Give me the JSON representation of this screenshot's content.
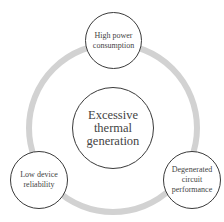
{
  "diagram": {
    "type": "cycle",
    "ring_color": "#d2d2d2",
    "stroke_color": "#3a3a3a",
    "text_color": "#444444",
    "center": {
      "label": "Excessive\nthermal\ngeneration"
    },
    "nodes": [
      {
        "position": "top",
        "label": "High power\nconsumption"
      },
      {
        "position": "bottom-right",
        "label": "Degenerated\ncircuit\nperformance"
      },
      {
        "position": "bottom-left",
        "label": "Low device\nreliability"
      }
    ]
  }
}
